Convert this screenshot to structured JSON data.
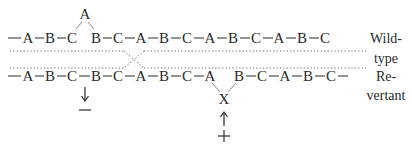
{
  "diagram": {
    "wildtype_strand": {
      "sequence": [
        "A",
        "B",
        "C",
        "B",
        "C",
        "A",
        "B",
        "C",
        "A",
        "B",
        "C",
        "A",
        "B",
        "C"
      ],
      "looped_out_base": "A",
      "leading_dash": true,
      "trailing_dash": false
    },
    "revertant_strand": {
      "sequence": [
        "A",
        "B",
        "C",
        "B",
        "C",
        "A",
        "B",
        "C",
        "A",
        "B",
        "C",
        "A",
        "B",
        "C"
      ],
      "inserted_base": "X",
      "leading_dash": true,
      "trailing_dash": true
    },
    "markers": {
      "deletion_sign": "−",
      "insertion_sign": "+",
      "down_arrow": "↓",
      "up_arrow": "↑"
    },
    "labels": {
      "wildtype_line1": "Wild-",
      "wildtype_line2": "type",
      "revertant_line1": "Re-",
      "revertant_line2": "vertant"
    }
  }
}
